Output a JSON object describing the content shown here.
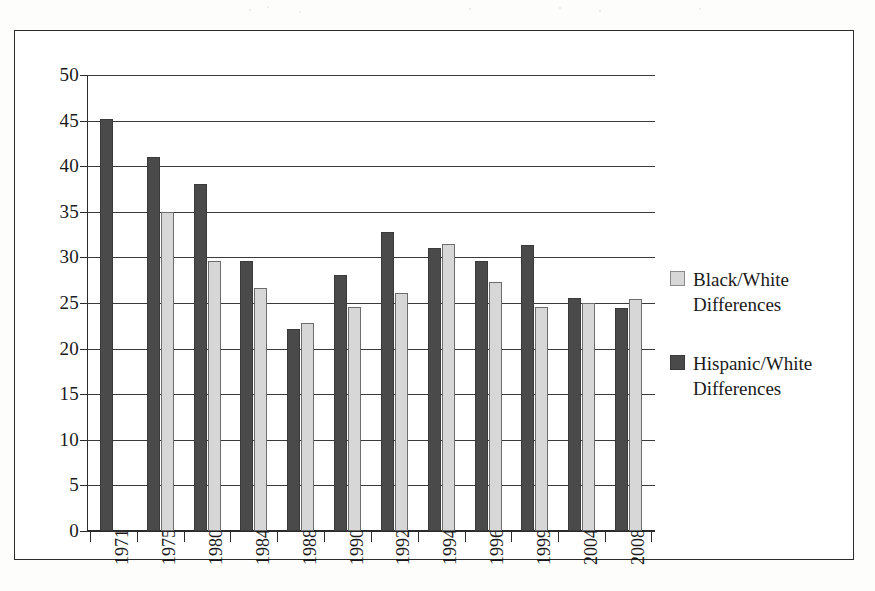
{
  "chart_data": {
    "type": "bar",
    "title": "",
    "subtitle": "",
    "xlabel": "",
    "ylabel": "",
    "categories": [
      "1971",
      "1975",
      "1980",
      "1984",
      "1988",
      "1990",
      "1992",
      "1994",
      "1996",
      "1999",
      "2004",
      "2008"
    ],
    "series": [
      {
        "name": "Black/White Differences",
        "color": "#d7d7d7",
        "values": [
          null,
          35.0,
          29.6,
          26.6,
          22.8,
          24.6,
          26.1,
          31.5,
          27.3,
          24.6,
          25.0,
          25.4
        ]
      },
      {
        "name": "Hispanic/White Differences",
        "color": "#4a4a4a",
        "values": [
          45.2,
          41.0,
          38.0,
          29.6,
          22.2,
          28.1,
          32.8,
          31.0,
          29.6,
          31.4,
          25.5,
          24.5
        ]
      }
    ],
    "ylim": [
      0,
      50
    ],
    "yticks": [
      0,
      5,
      10,
      15,
      20,
      25,
      30,
      35,
      40,
      45,
      50
    ],
    "ytick_labels": [
      "0",
      "5",
      "10",
      "15",
      "20",
      "25",
      "30",
      "35",
      "40",
      "45",
      "50"
    ],
    "grid": true,
    "grid_axis": "y",
    "legend_position": "right",
    "bar_orientation": "vertical",
    "xtick_rotation": -90
  },
  "legend": {
    "entries": [
      {
        "label_line1": "Black/White",
        "label_line2": "Differences",
        "swatch": "light-gray-swatch"
      },
      {
        "label_line1": "Hispanic/White",
        "label_line2": "Differences",
        "swatch": "dark-gray-swatch"
      }
    ]
  },
  "colors": {
    "series_light": "#d7d7d7",
    "series_dark": "#4a4a4a",
    "axis": "#2b2b2b",
    "grid": "#3a3a3a",
    "background": "#ffffff",
    "text": "#1a1a1a"
  }
}
